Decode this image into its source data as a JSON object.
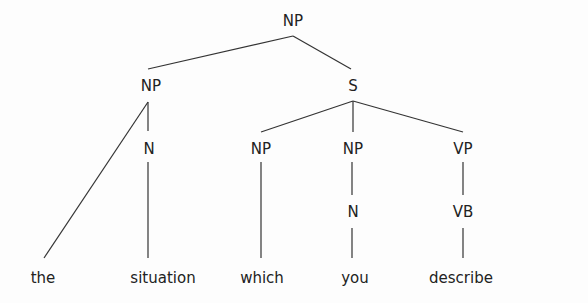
{
  "diagram": {
    "type": "syntax-tree",
    "nodes": [
      {
        "id": "np_root",
        "label": "NP",
        "x": 293,
        "y": 26
      },
      {
        "id": "np_left",
        "label": "NP",
        "x": 151,
        "y": 91
      },
      {
        "id": "s",
        "label": "S",
        "x": 353,
        "y": 91
      },
      {
        "id": "n_left",
        "label": "N",
        "x": 149,
        "y": 154
      },
      {
        "id": "np_which",
        "label": "NP",
        "x": 261,
        "y": 154
      },
      {
        "id": "np_you",
        "label": "NP",
        "x": 353,
        "y": 154
      },
      {
        "id": "vp",
        "label": "VP",
        "x": 463,
        "y": 154
      },
      {
        "id": "n_you",
        "label": "N",
        "x": 353,
        "y": 217
      },
      {
        "id": "vb",
        "label": "VB",
        "x": 463,
        "y": 217
      }
    ],
    "words": [
      {
        "id": "w_the",
        "text": "the",
        "x": 43,
        "y": 283
      },
      {
        "id": "w_situation",
        "text": "situation",
        "x": 163,
        "y": 283
      },
      {
        "id": "w_which",
        "text": "which",
        "x": 262,
        "y": 283
      },
      {
        "id": "w_you",
        "text": "you",
        "x": 355,
        "y": 283
      },
      {
        "id": "w_describe",
        "text": "describe",
        "x": 461,
        "y": 283
      }
    ],
    "edges": [
      {
        "from": "np_root",
        "to": "np_left",
        "x1": 293,
        "y1": 36,
        "x2": 148,
        "y2": 69
      },
      {
        "from": "np_root",
        "to": "s",
        "x1": 293,
        "y1": 36,
        "x2": 351,
        "y2": 69
      },
      {
        "from": "np_left",
        "to": "w_the",
        "x1": 148,
        "y1": 102,
        "x2": 44,
        "y2": 258
      },
      {
        "from": "np_left",
        "to": "n_left",
        "x1": 148,
        "y1": 102,
        "x2": 148,
        "y2": 131
      },
      {
        "from": "n_left",
        "to": "w_situation",
        "x1": 148,
        "y1": 162,
        "x2": 148,
        "y2": 258
      },
      {
        "from": "s",
        "to": "np_which",
        "x1": 353,
        "y1": 101,
        "x2": 261,
        "y2": 132
      },
      {
        "from": "s",
        "to": "np_you",
        "x1": 353,
        "y1": 101,
        "x2": 353,
        "y2": 132
      },
      {
        "from": "s",
        "to": "vp",
        "x1": 353,
        "y1": 101,
        "x2": 463,
        "y2": 132
      },
      {
        "from": "np_which",
        "to": "w_which",
        "x1": 261,
        "y1": 162,
        "x2": 261,
        "y2": 258
      },
      {
        "from": "np_you",
        "to": "n_you",
        "x1": 352,
        "y1": 162,
        "x2": 352,
        "y2": 195
      },
      {
        "from": "n_you",
        "to": "w_you",
        "x1": 352,
        "y1": 228,
        "x2": 352,
        "y2": 258
      },
      {
        "from": "vp",
        "to": "vb",
        "x1": 463,
        "y1": 162,
        "x2": 463,
        "y2": 195
      },
      {
        "from": "vb",
        "to": "w_describe",
        "x1": 463,
        "y1": 228,
        "x2": 463,
        "y2": 258
      }
    ]
  }
}
